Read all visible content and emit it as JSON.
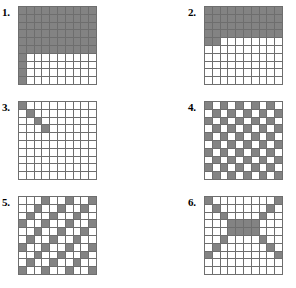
{
  "page": {
    "background_color": "#ffffff",
    "grid_line_color": "#6e6e6e",
    "filled_cell_color": "#838383",
    "empty_cell_color": "#ffffff",
    "grid_rows": 10,
    "grid_columns": 10
  },
  "puzzles": [
    {
      "label": "1.",
      "name": "puzzle-1",
      "pattern_description": "Top six rows fully shaded; leftmost column shaded in remaining four rows",
      "cells": [
        [
          1,
          1,
          1,
          1,
          1,
          1,
          1,
          1,
          1,
          1
        ],
        [
          1,
          1,
          1,
          1,
          1,
          1,
          1,
          1,
          1,
          1
        ],
        [
          1,
          1,
          1,
          1,
          1,
          1,
          1,
          1,
          1,
          1
        ],
        [
          1,
          1,
          1,
          1,
          1,
          1,
          1,
          1,
          1,
          1
        ],
        [
          1,
          1,
          1,
          1,
          1,
          1,
          1,
          1,
          1,
          1
        ],
        [
          1,
          1,
          1,
          1,
          1,
          1,
          1,
          1,
          1,
          1
        ],
        [
          1,
          0,
          0,
          0,
          0,
          0,
          0,
          0,
          0,
          0
        ],
        [
          1,
          0,
          0,
          0,
          0,
          0,
          0,
          0,
          0,
          0
        ],
        [
          1,
          0,
          0,
          0,
          0,
          0,
          0,
          0,
          0,
          0
        ],
        [
          1,
          0,
          0,
          0,
          0,
          0,
          0,
          0,
          0,
          0
        ]
      ]
    },
    {
      "label": "2.",
      "name": "puzzle-2",
      "pattern_description": "Top four rows fully shaded; fifth row shaded in first two columns",
      "cells": [
        [
          1,
          1,
          1,
          1,
          1,
          1,
          1,
          1,
          1,
          1
        ],
        [
          1,
          1,
          1,
          1,
          1,
          1,
          1,
          1,
          1,
          1
        ],
        [
          1,
          1,
          1,
          1,
          1,
          1,
          1,
          1,
          1,
          1
        ],
        [
          1,
          1,
          1,
          1,
          1,
          1,
          1,
          1,
          1,
          1
        ],
        [
          1,
          1,
          0,
          0,
          0,
          0,
          0,
          0,
          0,
          0
        ],
        [
          0,
          0,
          0,
          0,
          0,
          0,
          0,
          0,
          0,
          0
        ],
        [
          0,
          0,
          0,
          0,
          0,
          0,
          0,
          0,
          0,
          0
        ],
        [
          0,
          0,
          0,
          0,
          0,
          0,
          0,
          0,
          0,
          0
        ],
        [
          0,
          0,
          0,
          0,
          0,
          0,
          0,
          0,
          0,
          0
        ],
        [
          0,
          0,
          0,
          0,
          0,
          0,
          0,
          0,
          0,
          0
        ]
      ]
    },
    {
      "label": "3.",
      "name": "puzzle-3",
      "pattern_description": "Short diagonal of four shaded squares from the top-left corner",
      "cells": [
        [
          1,
          0,
          0,
          0,
          0,
          0,
          0,
          0,
          0,
          0
        ],
        [
          0,
          1,
          0,
          0,
          0,
          0,
          0,
          0,
          0,
          0
        ],
        [
          0,
          0,
          1,
          0,
          0,
          0,
          0,
          0,
          0,
          0
        ],
        [
          0,
          0,
          0,
          1,
          0,
          0,
          0,
          0,
          0,
          0
        ],
        [
          0,
          0,
          0,
          0,
          0,
          0,
          0,
          0,
          0,
          0
        ],
        [
          0,
          0,
          0,
          0,
          0,
          0,
          0,
          0,
          0,
          0
        ],
        [
          0,
          0,
          0,
          0,
          0,
          0,
          0,
          0,
          0,
          0
        ],
        [
          0,
          0,
          0,
          0,
          0,
          0,
          0,
          0,
          0,
          0
        ],
        [
          0,
          0,
          0,
          0,
          0,
          0,
          0,
          0,
          0,
          0
        ],
        [
          0,
          0,
          0,
          0,
          0,
          0,
          0,
          0,
          0,
          0
        ]
      ]
    },
    {
      "label": "4.",
      "name": "puzzle-4",
      "pattern_description": "Checkerboard pattern beginning with a shaded square in the top-left corner",
      "cells": [
        [
          1,
          0,
          1,
          0,
          1,
          0,
          1,
          0,
          1,
          0
        ],
        [
          0,
          1,
          0,
          1,
          0,
          1,
          0,
          1,
          0,
          1
        ],
        [
          1,
          0,
          1,
          0,
          1,
          0,
          1,
          0,
          1,
          0
        ],
        [
          0,
          1,
          0,
          1,
          0,
          1,
          0,
          1,
          0,
          1
        ],
        [
          1,
          0,
          1,
          0,
          1,
          0,
          1,
          0,
          1,
          0
        ],
        [
          0,
          1,
          0,
          1,
          0,
          1,
          0,
          1,
          0,
          1
        ],
        [
          1,
          0,
          1,
          0,
          1,
          0,
          1,
          0,
          1,
          0
        ],
        [
          0,
          1,
          0,
          1,
          0,
          1,
          0,
          1,
          0,
          1
        ],
        [
          1,
          0,
          1,
          0,
          1,
          0,
          1,
          0,
          1,
          0
        ],
        [
          0,
          1,
          0,
          1,
          0,
          1,
          0,
          1,
          0,
          1
        ]
      ]
    },
    {
      "label": "5.",
      "name": "puzzle-5",
      "pattern_description": "Repeating parallel diagonal stripes running down to the left, every third column",
      "cells": [
        [
          0,
          0,
          0,
          1,
          0,
          0,
          1,
          0,
          0,
          1
        ],
        [
          0,
          0,
          1,
          0,
          0,
          1,
          0,
          0,
          1,
          0
        ],
        [
          0,
          1,
          0,
          0,
          1,
          0,
          0,
          1,
          0,
          0
        ],
        [
          1,
          0,
          0,
          1,
          0,
          0,
          1,
          0,
          0,
          1
        ],
        [
          0,
          0,
          1,
          0,
          0,
          1,
          0,
          0,
          1,
          0
        ],
        [
          0,
          1,
          0,
          0,
          1,
          0,
          0,
          1,
          0,
          0
        ],
        [
          1,
          0,
          0,
          1,
          0,
          0,
          1,
          0,
          0,
          1
        ],
        [
          0,
          0,
          1,
          0,
          0,
          1,
          0,
          0,
          1,
          0
        ],
        [
          0,
          1,
          0,
          0,
          1,
          0,
          0,
          1,
          0,
          0
        ],
        [
          1,
          0,
          0,
          1,
          0,
          0,
          1,
          0,
          0,
          1
        ]
      ]
    },
    {
      "label": "6.",
      "name": "puzzle-6",
      "pattern_description": "Large X formed by two crossing diagonals meeting in a thick centre block",
      "cells": [
        [
          1,
          0,
          0,
          0,
          0,
          0,
          0,
          0,
          0,
          1
        ],
        [
          0,
          1,
          0,
          0,
          0,
          0,
          0,
          0,
          1,
          0
        ],
        [
          0,
          0,
          1,
          0,
          0,
          0,
          0,
          1,
          0,
          0
        ],
        [
          0,
          0,
          0,
          1,
          1,
          1,
          1,
          0,
          0,
          0
        ],
        [
          0,
          0,
          0,
          1,
          1,
          1,
          1,
          0,
          0,
          0
        ],
        [
          0,
          0,
          1,
          0,
          0,
          0,
          0,
          1,
          0,
          0
        ],
        [
          0,
          1,
          0,
          0,
          0,
          0,
          0,
          0,
          1,
          0
        ],
        [
          1,
          0,
          0,
          0,
          0,
          0,
          0,
          0,
          0,
          1
        ],
        [
          0,
          0,
          0,
          0,
          0,
          0,
          0,
          0,
          0,
          0
        ],
        [
          0,
          0,
          0,
          0,
          0,
          0,
          0,
          0,
          0,
          0
        ]
      ]
    }
  ]
}
